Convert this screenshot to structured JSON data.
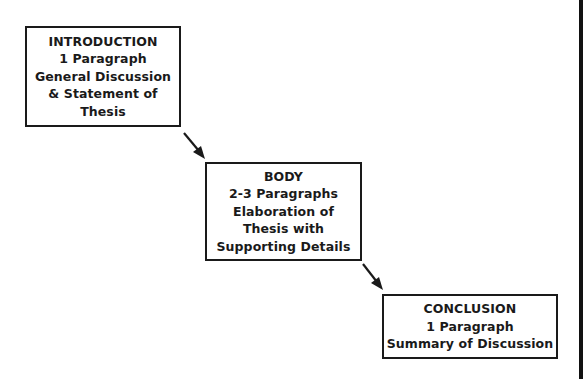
{
  "diagram": {
    "type": "flow",
    "direction": "top-left to bottom-right",
    "boxes": [
      {
        "id": "introduction",
        "lines": [
          "INTRODUCTION",
          "1 Paragraph",
          "General Discussion",
          "& Statement of",
          "Thesis"
        ]
      },
      {
        "id": "body",
        "lines": [
          "BODY",
          "2-3 Paragraphs",
          "Elaboration of",
          "Thesis with",
          "Supporting Details"
        ]
      },
      {
        "id": "conclusion",
        "lines": [
          "CONCLUSION",
          "1 Paragraph",
          "Summary of Discussion"
        ]
      }
    ],
    "arrows": [
      {
        "from": "introduction",
        "to": "body"
      },
      {
        "from": "body",
        "to": "conclusion"
      }
    ],
    "colors": {
      "stroke": "#1a1a1a",
      "text": "#1a1a1a",
      "background": "#ffffff"
    }
  }
}
